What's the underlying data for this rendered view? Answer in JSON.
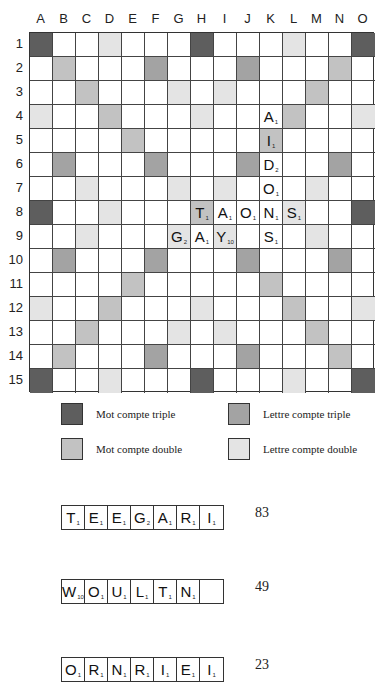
{
  "board": {
    "columns": [
      "A",
      "B",
      "C",
      "D",
      "E",
      "F",
      "G",
      "H",
      "I",
      "J",
      "K",
      "L",
      "M",
      "N",
      "O"
    ],
    "rows": [
      "1",
      "2",
      "3",
      "4",
      "5",
      "6",
      "7",
      "8",
      "9",
      "10",
      "11",
      "12",
      "13",
      "14",
      "15"
    ],
    "premium_colors": {
      "TW": "#5e5e5e",
      "TL": "#a3a3a3",
      "DW": "#c2c2c2",
      "DL": "#e4e4e4"
    },
    "premium_layout": [
      "TW,,,DL,,,,TW,,,,DL,,,TW",
      ",DW,,,,TL,,,,TL,,,,DW,",
      ",,DW,,,,DL,,DL,,,,DW,,",
      "DL,,,DW,,,,DL,,,,DW,,,DL",
      ",,,,DW,,,,,,DW,,,,",
      ",TL,,,,TL,,,,TL,,,,TL,",
      ",,DL,,,,DL,,DL,,,,DL,,",
      "TW,,,DL,,,,DW,,,,DL,,,TW",
      ",,DL,,,,DL,,DL,,,,DL,,",
      ",TL,,,,TL,,,,TL,,,,TL,",
      ",,,,DW,,,,,,DW,,,,",
      "DL,,,DW,,,,DL,,,,DW,,,DL",
      ",,DW,,,,DL,,DL,,,,DW,,",
      ",DW,,,,TL,,,,TL,,,,DW,",
      "TW,,,DL,,,,TW,,,,DL,,,TW"
    ],
    "tiles": [
      {
        "cell": "K4",
        "letter": "A",
        "value": "1"
      },
      {
        "cell": "K5",
        "letter": "I",
        "value": "1"
      },
      {
        "cell": "K6",
        "letter": "D",
        "value": "2"
      },
      {
        "cell": "K7",
        "letter": "O",
        "value": "1"
      },
      {
        "cell": "H8",
        "letter": "T",
        "value": "1"
      },
      {
        "cell": "I8",
        "letter": "A",
        "value": "1"
      },
      {
        "cell": "J8",
        "letter": "O",
        "value": "1"
      },
      {
        "cell": "K8",
        "letter": "N",
        "value": "1"
      },
      {
        "cell": "L8",
        "letter": "S",
        "value": "1"
      },
      {
        "cell": "G9",
        "letter": "G",
        "value": "2"
      },
      {
        "cell": "H9",
        "letter": "A",
        "value": "1"
      },
      {
        "cell": "I9",
        "letter": "Y",
        "value": "10"
      },
      {
        "cell": "K9",
        "letter": "S",
        "value": "1"
      }
    ]
  },
  "legend": {
    "mot_triple": "Mot compte triple",
    "lettre_triple": "Lettre compte triple",
    "mot_double": "Mot compte double",
    "lettre_double": "Lettre compte double"
  },
  "racks": [
    {
      "tiles": [
        {
          "l": "T",
          "v": "1"
        },
        {
          "l": "E",
          "v": "1"
        },
        {
          "l": "E",
          "v": "1"
        },
        {
          "l": "G",
          "v": "2"
        },
        {
          "l": "A",
          "v": "1"
        },
        {
          "l": "R",
          "v": "1"
        },
        {
          "l": "I",
          "v": "1"
        }
      ],
      "score": "83"
    },
    {
      "tiles": [
        {
          "l": "W",
          "v": "10"
        },
        {
          "l": "O",
          "v": "1"
        },
        {
          "l": "U",
          "v": "1"
        },
        {
          "l": "L",
          "v": "1"
        },
        {
          "l": "T",
          "v": "1"
        },
        {
          "l": "N",
          "v": "1"
        },
        {
          "l": "",
          "v": ""
        }
      ],
      "score": "49"
    },
    {
      "tiles": [
        {
          "l": "O",
          "v": "1"
        },
        {
          "l": "R",
          "v": "1"
        },
        {
          "l": "N",
          "v": "1"
        },
        {
          "l": "R",
          "v": "1"
        },
        {
          "l": "I",
          "v": "1"
        },
        {
          "l": "E",
          "v": "1"
        },
        {
          "l": "I",
          "v": "1"
        }
      ],
      "score": "23"
    }
  ]
}
